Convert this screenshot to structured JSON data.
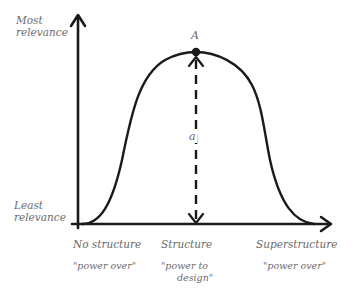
{
  "diagram": {
    "y_axis": {
      "top_label_line1": "Most",
      "top_label_line2": "relevance",
      "bottom_label_line1": "Least",
      "bottom_label_line2": "relevance"
    },
    "x_axis": {
      "categories": [
        {
          "label": "No structure",
          "sublabel_line1": "\"power over\"",
          "sublabel_line2": ""
        },
        {
          "label": "Structure",
          "sublabel_line1": "\"power to",
          "sublabel_line2": "design\""
        },
        {
          "label": "Superstructure",
          "sublabel_line1": "\"power over\"",
          "sublabel_line2": ""
        }
      ]
    },
    "peak_point_label": "A",
    "height_marker_label": "a",
    "colors": {
      "line": "#1a1a1a",
      "text": "#6b6b6b"
    }
  }
}
